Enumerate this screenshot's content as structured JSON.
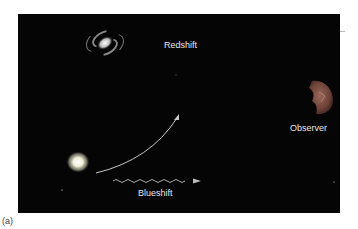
{
  "figure": {
    "caption": "(a)",
    "labels": {
      "redshift": "Redshift",
      "blueshift": "Blueshift",
      "observer": "Observer"
    },
    "objects": [
      {
        "name": "spiral-galaxy",
        "x": 105,
        "y": 43
      },
      {
        "name": "glowing-star-source",
        "x": 78,
        "y": 162
      },
      {
        "name": "observer-eye",
        "x": 320,
        "y": 98
      }
    ],
    "colors": {
      "background": "#050505",
      "arrow": "#c8c8c8",
      "text": "#e8e8e8"
    }
  }
}
